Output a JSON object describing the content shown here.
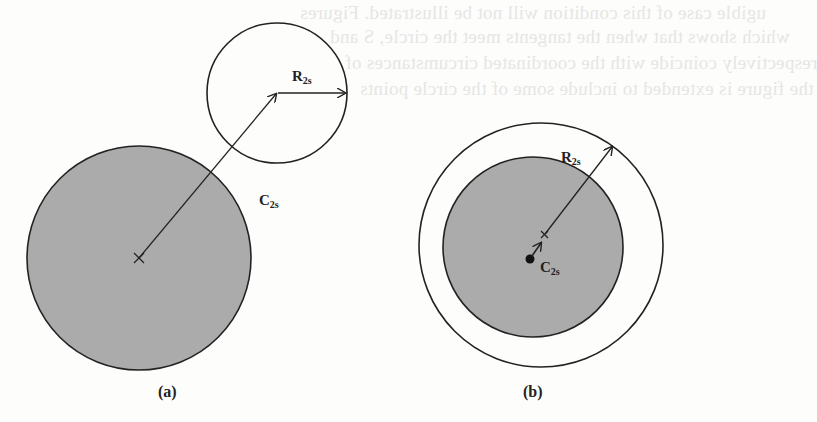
{
  "figure": {
    "panels": [
      {
        "id": "a",
        "caption": "(a)",
        "labels": {
          "radius": "R",
          "radius_sub": "2s",
          "center": "C",
          "center_sub": "2s"
        },
        "description": "Large shaded circle with center marker; arrow from center to center of a small unshaded circle outside; radius arrow inside small circle"
      },
      {
        "id": "b",
        "caption": "(b)",
        "labels": {
          "radius": "R",
          "radius_sub": "2s",
          "center": "C",
          "center_sub": "2s"
        },
        "description": "Shaded circle enclosed by larger unshaded circle; small arrow from filled dot to center marker; radius arrow to outer circle"
      }
    ],
    "colors": {
      "fill": "#ababab",
      "stroke": "#222222",
      "background": "#fdfdfc",
      "bleed_text": "#e6e6e4"
    }
  },
  "bleed_through_text": [
    "ugible case of this condition will not be illustrated. Figures",
    "which shows that when the tangents meet the circle, S and",
    "respectively coincide with the coordinated circumstances of",
    "the figure is extended to include some of the circle points"
  ]
}
